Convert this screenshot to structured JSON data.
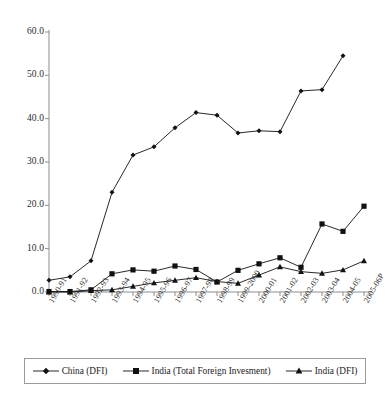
{
  "chart_data": {
    "type": "line",
    "title": "",
    "subtitle": "",
    "xlabel": "",
    "ylabel": "",
    "ylim": [
      0.0,
      60.0
    ],
    "yticks": [
      "0.0",
      "10.0",
      "20.0",
      "30.0",
      "40.0",
      "50.0",
      "60.0"
    ],
    "ytick_values": [
      0,
      10,
      20,
      30,
      40,
      50,
      60
    ],
    "grid": false,
    "legend_position": "bottom",
    "categories": [
      "1990-91",
      "1991-92",
      "1992-93",
      "1993-94",
      "1994-95",
      "1995-96",
      "1996-97",
      "1997-98",
      "1998-99",
      "1999-2000",
      "2000-01",
      "2001-02",
      "2002-03",
      "2003-04",
      "2004-05",
      "2005-06P"
    ],
    "series": [
      {
        "name": "China (DFI)",
        "marker": "diamond",
        "values": [
          2.7,
          3.5,
          7.2,
          23.0,
          31.6,
          33.5,
          37.9,
          41.4,
          40.8,
          36.7,
          37.2,
          37.0,
          46.4,
          46.7,
          54.5,
          null
        ]
      },
      {
        "name": "India (Total Foreign Invesment)",
        "marker": "square",
        "values": [
          0.1,
          0.1,
          0.5,
          4.2,
          5.1,
          4.8,
          6.0,
          5.2,
          2.3,
          5.0,
          6.5,
          7.9,
          5.7,
          15.7,
          14.0,
          19.8
        ]
      },
      {
        "name": "India (DFI)",
        "marker": "triangle",
        "values": [
          0.0,
          0.0,
          0.3,
          0.5,
          1.3,
          2.1,
          2.7,
          3.3,
          2.4,
          2.0,
          3.9,
          5.8,
          4.7,
          4.3,
          5.1,
          7.2
        ]
      }
    ]
  },
  "legend": {
    "items": [
      {
        "label": "China (DFI)",
        "marker": "diamond-marker-icon"
      },
      {
        "label": "India (Total Foreign Invesment)",
        "marker": "square-marker-icon"
      },
      {
        "label": "India (DFI)",
        "marker": "triangle-marker-icon"
      }
    ]
  },
  "colors": {
    "series": "#111111",
    "axis": "#8d8d8d",
    "text": "#1a1a1a",
    "legend_border": "#9a9a9a",
    "background": "#ffffff"
  }
}
